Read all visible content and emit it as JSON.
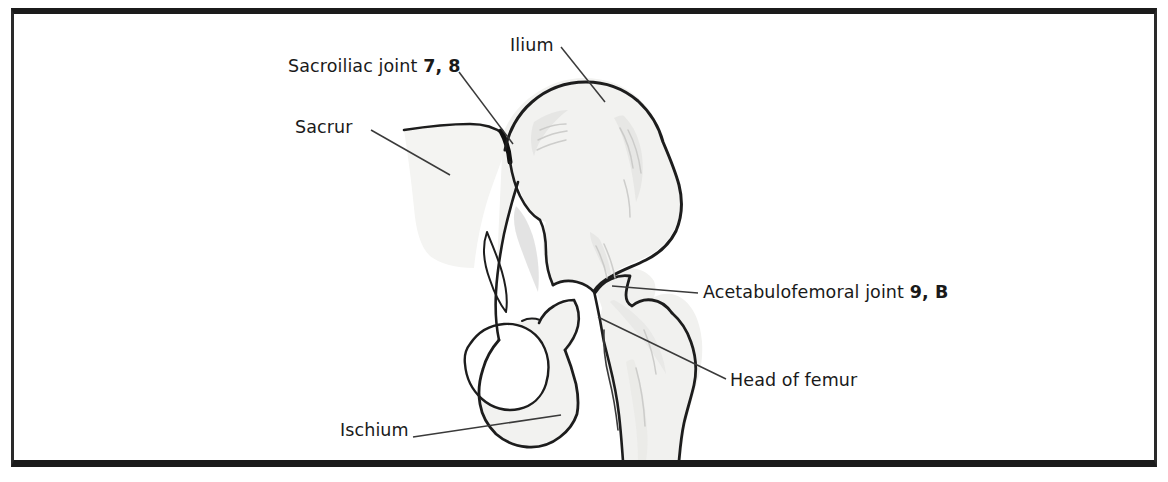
{
  "figure": {
    "kind": "anatomical-illustration",
    "alt": "Line drawing of the pelvis and proximal femur with labelled joints",
    "colors": {
      "frame": "#1b1b1b",
      "background": "#ffffff",
      "bone_fill": "#f2f2f0",
      "bone_outline": "#1d1d1d",
      "shading": "#d8d8d6",
      "leader_line": "#3a3a3a",
      "text": "#1a1a1a"
    }
  },
  "labels": {
    "sacroiliac": {
      "text": "Sacroiliac joint ",
      "code": "7, 8"
    },
    "ilium": {
      "text": "Ilium",
      "code": ""
    },
    "sacrum": {
      "text": "Sacrur",
      "code": ""
    },
    "acetabulofemoral": {
      "text": "Acetabulofemoral joint ",
      "code": "9, B"
    },
    "head_of_femur": {
      "text": "Head of femur",
      "code": ""
    },
    "ischium": {
      "text": "Ischium",
      "code": ""
    }
  }
}
